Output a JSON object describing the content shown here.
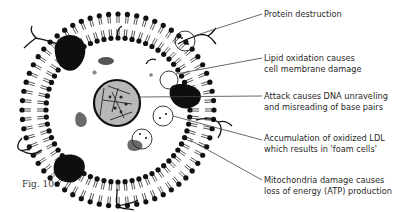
{
  "figure": {
    "caption": "Fig. 10"
  },
  "labels": [
    {
      "id": "protein",
      "lines": [
        "Protein destruction"
      ],
      "top": 9
    },
    {
      "id": "lipid",
      "lines": [
        "Lipid oxidation causes",
        "cell membrane damage"
      ],
      "top": 53
    },
    {
      "id": "dna",
      "lines": [
        "Attack causes DNA unraveling",
        "and misreading of base pairs"
      ],
      "top": 91
    },
    {
      "id": "ldl",
      "lines": [
        "Accumulation of oxidized LDL",
        "which results in 'foam cells'"
      ],
      "top": 133
    },
    {
      "id": "mito",
      "lines": [
        "Mitochondria damage causes",
        "loss of energy (ATP) production"
      ],
      "top": 175
    }
  ],
  "colors": {
    "membrane": "#111111",
    "nucleus_fill": "#b8b8b8",
    "organelle": "#6a6a6a",
    "text": "#2a2a2a",
    "leader_line": "#444444"
  }
}
